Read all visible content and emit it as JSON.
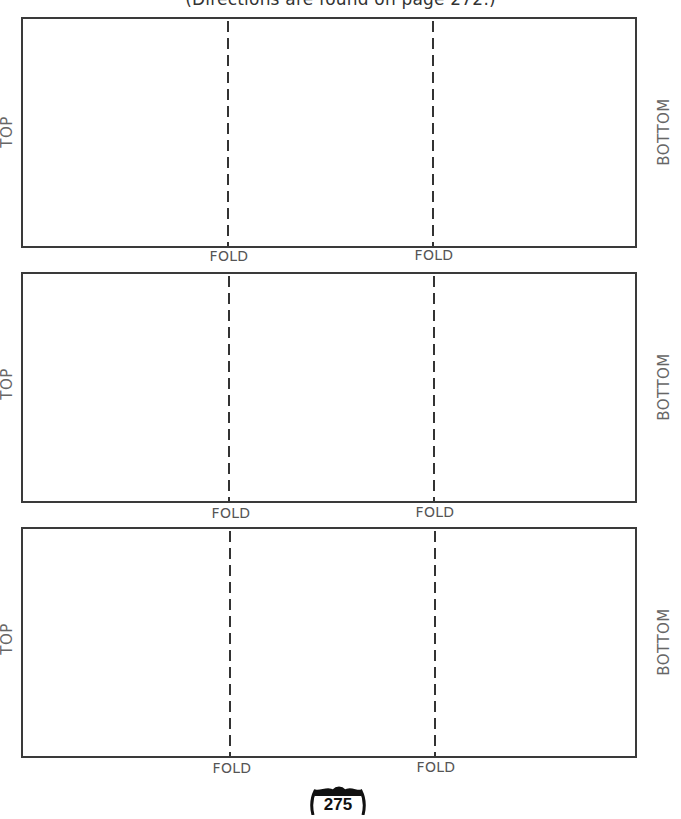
{
  "header": {
    "directions": "(Directions are found on page 272.)"
  },
  "panels": [
    {
      "top_label": "TOP",
      "bottom_label": "BOTTOM",
      "fold_labels": [
        "FOLD",
        "FOLD"
      ]
    },
    {
      "top_label": "TOP",
      "bottom_label": "BOTTOM",
      "fold_labels": [
        "FOLD",
        "FOLD"
      ]
    },
    {
      "top_label": "TOP",
      "bottom_label": "BOTTOM",
      "fold_labels": [
        "FOLD",
        "FOLD"
      ]
    }
  ],
  "footer": {
    "page_number": "275",
    "page_badge_icon": "interstate-shield-icon"
  }
}
